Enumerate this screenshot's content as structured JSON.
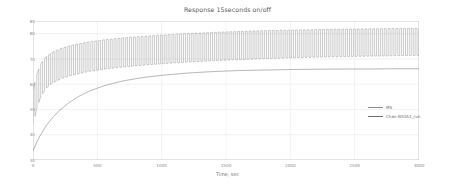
{
  "chart_data": {
    "type": "line",
    "title": "Response 15seconds on/off",
    "xlabel": "Time, sec",
    "ylabel": "Temperature, °C",
    "xlim": [
      0,
      3000
    ],
    "ylim": [
      30,
      85
    ],
    "grid": true,
    "legend_position": "lower right",
    "xticks": [
      0,
      500,
      1000,
      1500,
      2000,
      2500,
      3000
    ],
    "xtick_labels": [
      "0",
      "500",
      "1000",
      "1500",
      "2000",
      "2500",
      "3000"
    ],
    "yticks": [
      30,
      40,
      50,
      60,
      70,
      80,
      85
    ],
    "ytick_labels": [
      "30",
      "40",
      "50",
      "60",
      "70",
      "80",
      "85"
    ],
    "series": [
      {
        "name": "MS",
        "color": "#8a8a8a",
        "linewidth": 0.45,
        "description": "Oscillating response, 15 s on / 15 s off duty cycle; envelope rises from roughly 45-60 °C early to a steady 72-82 °C band.",
        "envelope_upper": {
          "x": [
            0,
            30,
            60,
            100,
            150,
            220,
            300,
            420,
            560,
            720,
            900,
            1150,
            1450,
            1800,
            2200,
            2600,
            3000
          ],
          "y": [
            57.5,
            64.0,
            68.0,
            70.8,
            72.6,
            74.2,
            75.4,
            76.6,
            77.6,
            78.4,
            79.1,
            79.9,
            80.6,
            81.2,
            81.6,
            81.9,
            82.1
          ]
        },
        "envelope_lower": {
          "x": [
            0,
            30,
            60,
            100,
            150,
            220,
            300,
            420,
            560,
            720,
            900,
            1150,
            1450,
            1800,
            2200,
            2600,
            3000
          ],
          "y": [
            44.0,
            50.5,
            55.0,
            58.3,
            60.4,
            62.2,
            63.5,
            64.9,
            66.0,
            66.9,
            67.7,
            68.6,
            69.4,
            70.1,
            70.7,
            71.1,
            71.4
          ]
        },
        "period_sec": 30,
        "start_value": 45.0
      },
      {
        "name": "Chan NS3A1_run",
        "color": "#707070",
        "linewidth": 0.55,
        "description": "Smooth first-order exponential rise from about 33.5 °C to an asymptote near 66 °C.",
        "x": [
          0,
          25,
          50,
          100,
          150,
          200,
          280,
          360,
          450,
          560,
          700,
          850,
          1000,
          1200,
          1400,
          1600,
          1800,
          2000,
          2200,
          2400,
          2600,
          2800,
          3000
        ],
        "y": [
          33.5,
          36.6,
          39.2,
          43.4,
          46.6,
          49.3,
          52.7,
          55.3,
          57.5,
          59.5,
          61.3,
          62.6,
          63.5,
          64.4,
          65.0,
          65.4,
          65.6,
          65.8,
          65.9,
          66.0,
          66.0,
          66.1,
          66.1
        ]
      }
    ]
  },
  "legend": {
    "entries": [
      {
        "label": "MS"
      },
      {
        "label": "Chan NS3A1_run"
      }
    ]
  },
  "style": {
    "background": "#ffffff",
    "grid_color": "#e4e4e4",
    "axis_color": "#b8b8b8",
    "tick_text_color": "#8a8a8a",
    "title_color": "#5a5a5a"
  }
}
